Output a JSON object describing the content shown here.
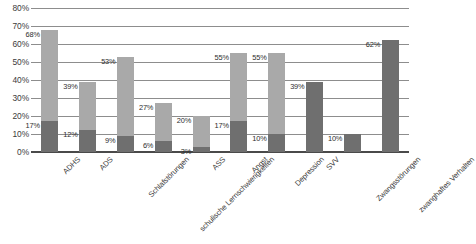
{
  "chart_data": {
    "type": "bar",
    "title": "",
    "subtitle": "",
    "xlabel": "",
    "ylabel": "",
    "ylim": [
      0,
      80
    ],
    "ytick_labels": [
      "0%",
      "10%",
      "20%",
      "30%",
      "40%",
      "50%",
      "60%",
      "70%",
      "80%"
    ],
    "ytick_values": [
      0,
      10,
      20,
      30,
      40,
      50,
      60,
      70,
      80
    ],
    "grid": true,
    "legend": "none",
    "bar_style": "overlaid",
    "categories": [
      "ADHS",
      "ADS",
      "Schlafstörungen",
      "schulische Lernschwierigkeiten",
      "ASS",
      "Angst",
      "Depression",
      "SVV",
      "Zwangsstörungen",
      "zwanghaftes Verhalten"
    ],
    "series": [
      {
        "name": "light",
        "color": "#a9a9a9",
        "values": [
          68,
          39,
          53,
          27,
          20,
          55,
          55,
          null,
          null,
          null
        ],
        "labels": [
          "68%",
          "39%",
          "53%",
          "27%",
          "20%",
          "55%",
          "55%",
          "",
          "",
          ""
        ]
      },
      {
        "name": "dark",
        "color": "#6f6f6f",
        "values": [
          17,
          12,
          9,
          6,
          3,
          17,
          10,
          39,
          10,
          62
        ],
        "labels": [
          "17%",
          "12%",
          "9%",
          "6%",
          "3%",
          "17%",
          "10%",
          "39%",
          "10%",
          "62%"
        ]
      }
    ]
  },
  "colors": {
    "light_bar": "#a9a9a9",
    "dark_bar": "#6f6f6f",
    "gridline": "#8d8d8d",
    "axis": "#4a4a4a",
    "text": "#3a3a3a",
    "background": "#ffffff"
  }
}
